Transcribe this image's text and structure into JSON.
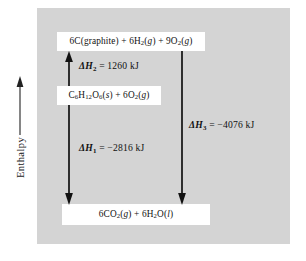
{
  "diagram": {
    "title_axis": "Enthalpy",
    "background_color": "#d4d4d4",
    "box_color": "#ffffff",
    "ink_color": "#111111",
    "boxes": [
      {
        "id": "elements",
        "text": "6C(graphite) + 6H2(g) + 9O2(g)",
        "position": "top"
      },
      {
        "id": "glucose",
        "text": "C6H12O6(s) + 6O2(g)",
        "position": "middle"
      },
      {
        "id": "products",
        "text": "6CO2(g) + 6H2O(l)",
        "position": "bottom"
      }
    ],
    "transitions": [
      {
        "id": "dH2",
        "label": "ΔH2 = 1260 kJ",
        "value": 1260,
        "unit": "kJ",
        "direction": "up",
        "from": "glucose",
        "to": "elements"
      },
      {
        "id": "dH1",
        "label": "ΔH1 = −2816 kJ",
        "value": -2816,
        "unit": "kJ",
        "direction": "down",
        "from": "glucose",
        "to": "products"
      },
      {
        "id": "dH3",
        "label": "ΔH3 = −4076 kJ",
        "value": -4076,
        "unit": "kJ",
        "direction": "down",
        "from": "elements",
        "to": "products"
      }
    ]
  }
}
